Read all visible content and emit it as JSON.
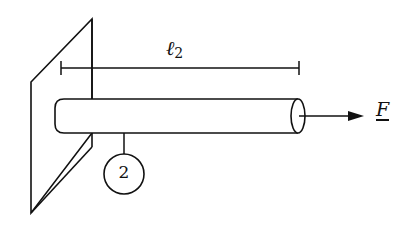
{
  "diagram": {
    "type": "cantilever-bar",
    "labels": {
      "length_symbol": "ℓ",
      "length_index": "2",
      "force": "F",
      "element_number": "2"
    },
    "colors": {
      "stroke": "#111111",
      "background": "#ffffff"
    }
  }
}
